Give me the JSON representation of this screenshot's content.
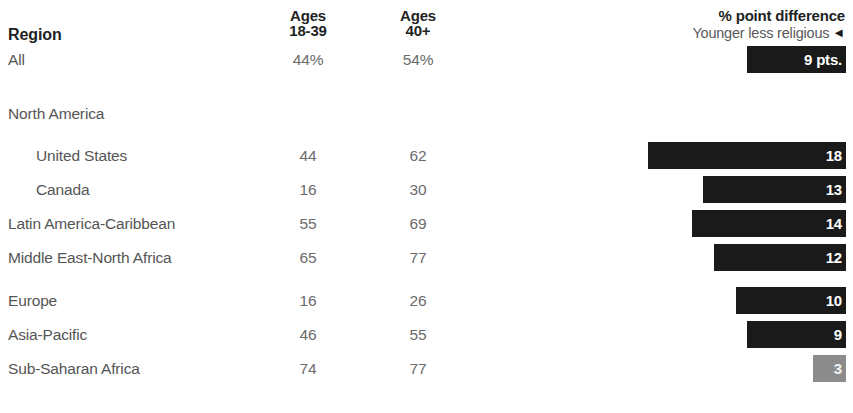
{
  "header": {
    "region_label": "Region",
    "ages_young": {
      "line1": "Ages",
      "line2": "18-39"
    },
    "ages_old": {
      "line1": "Ages",
      "line2": "40+"
    },
    "diff_title": "% point difference",
    "diff_subtitle": "Younger less religious",
    "diff_arrow": "◄"
  },
  "colors": {
    "bar_dark": "#1a1a1a",
    "bar_light": "#8c8c8c",
    "text": "#555555",
    "header_text": "#221f1f"
  },
  "rows": [
    {
      "label": "All",
      "indent": false,
      "spacer": false,
      "young": "44%",
      "old": "54%",
      "diff": 9,
      "diff_label": "9 pts.",
      "light": false
    },
    {
      "label": "North America",
      "indent": false,
      "spacer": false,
      "young": "",
      "old": "",
      "diff": null,
      "diff_label": "",
      "light": false
    },
    {
      "label": "United States",
      "indent": true,
      "spacer": false,
      "young": "44",
      "old": "62",
      "diff": 18,
      "diff_label": "18",
      "light": false
    },
    {
      "label": "Canada",
      "indent": true,
      "spacer": false,
      "young": "16",
      "old": "30",
      "diff": 13,
      "diff_label": "13",
      "light": false
    },
    {
      "label": "Latin America-Caribbean",
      "indent": false,
      "spacer": false,
      "young": "55",
      "old": "69",
      "diff": 14,
      "diff_label": "14",
      "light": false
    },
    {
      "label": "Middle East-North Africa",
      "indent": false,
      "spacer": false,
      "young": "65",
      "old": "77",
      "diff": 12,
      "diff_label": "12",
      "light": false
    },
    {
      "label": "Europe",
      "indent": false,
      "spacer": false,
      "young": "16",
      "old": "26",
      "diff": 10,
      "diff_label": "10",
      "light": false
    },
    {
      "label": "Asia-Pacific",
      "indent": false,
      "spacer": false,
      "young": "46",
      "old": "55",
      "diff": 9,
      "diff_label": "9",
      "light": false
    },
    {
      "label": "Sub-Saharan Africa",
      "indent": false,
      "spacer": false,
      "young": "74",
      "old": "77",
      "diff": 3,
      "diff_label": "3",
      "light": true
    }
  ],
  "chart_data": {
    "type": "bar",
    "title": "% point difference",
    "subtitle": "Younger less religious",
    "orientation": "horizontal",
    "xlabel": "",
    "ylabel": "Region",
    "grid": false,
    "legend": "none",
    "categories": [
      "All",
      "United States",
      "Canada",
      "Latin America-Caribbean",
      "Middle East-North Africa",
      "Europe",
      "Asia-Pacific",
      "Sub-Saharan Africa"
    ],
    "values": [
      9,
      18,
      13,
      14,
      12,
      10,
      9,
      3
    ],
    "value_labels": [
      "9 pts.",
      "18",
      "13",
      "14",
      "12",
      "10",
      "9",
      "3"
    ],
    "xlim": [
      0,
      18
    ],
    "table_columns": [
      "Region",
      "Ages 18-39",
      "Ages 40+",
      "% point difference"
    ],
    "series": [
      {
        "name": "Ages 18-39",
        "values": [
          44,
          44,
          16,
          55,
          65,
          16,
          46,
          74
        ]
      },
      {
        "name": "Ages 40+",
        "values": [
          54,
          62,
          30,
          69,
          77,
          26,
          55,
          77
        ]
      },
      {
        "name": "% point difference",
        "values": [
          9,
          18,
          13,
          14,
          12,
          10,
          9,
          3
        ]
      }
    ]
  }
}
